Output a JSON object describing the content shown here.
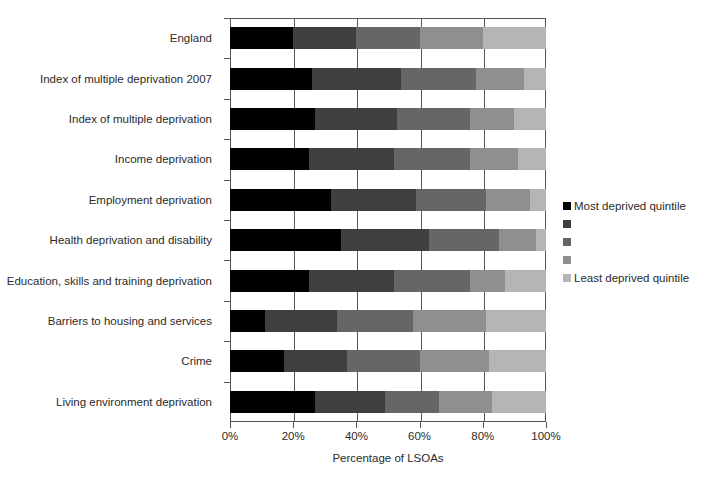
{
  "chart_data": {
    "type": "bar",
    "orientation": "horizontal",
    "stacked": true,
    "normalized": true,
    "title": "",
    "xlabel": "Percentage of LSOAs",
    "ylabel": "",
    "xlim": [
      0,
      100
    ],
    "xticks": [
      0,
      20,
      40,
      60,
      80,
      100
    ],
    "xtick_labels": [
      "0%",
      "20%",
      "40%",
      "60%",
      "80%",
      "100%"
    ],
    "grid": true,
    "legend_position": "right",
    "categories": [
      "England",
      "Index of multiple deprivation 2007",
      "Index of multiple deprivation",
      "Income deprivation",
      "Employment deprivation",
      "Health deprivation and disability",
      "Education, skills and training deprivation",
      "Barriers to housing and services",
      "Crime",
      "Living environment deprivation"
    ],
    "series": [
      {
        "name": "Most deprived quintile",
        "color": "#000000",
        "values": [
          20,
          26,
          27,
          25,
          32,
          35,
          25,
          11,
          17,
          27
        ]
      },
      {
        "name": "",
        "color": "#3f3f3f",
        "values": [
          20,
          28,
          26,
          27,
          27,
          28,
          27,
          23,
          20,
          22
        ]
      },
      {
        "name": "",
        "color": "#666666",
        "values": [
          20,
          24,
          23,
          24,
          22,
          22,
          24,
          24,
          23,
          17
        ]
      },
      {
        "name": "",
        "color": "#8f8f8f",
        "values": [
          20,
          15,
          14,
          15,
          14,
          12,
          11,
          23,
          22,
          17
        ]
      },
      {
        "name": "Least deprived quintile",
        "color": "#b5b5b5",
        "values": [
          20,
          7,
          10,
          9,
          5,
          3,
          13,
          19,
          18,
          17
        ]
      }
    ]
  },
  "legend": {
    "entries": [
      {
        "label": "Most deprived quintile",
        "color": "#000000"
      },
      {
        "label": "",
        "color": "#3f3f3f"
      },
      {
        "label": "",
        "color": "#666666"
      },
      {
        "label": "",
        "color": "#8f8f8f"
      },
      {
        "label": "Least deprived quintile",
        "color": "#b5b5b5"
      }
    ]
  },
  "axis": {
    "x_title": "Percentage of LSOAs"
  }
}
